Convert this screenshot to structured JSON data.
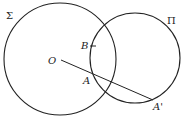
{
  "diagram": {
    "circles": [
      {
        "name": "Σ",
        "cx": 60,
        "cy": 59,
        "r": 56,
        "label_x": 6,
        "label_y": 19
      },
      {
        "name": "Π",
        "cx": 135,
        "cy": 58,
        "r": 45,
        "label_x": 167,
        "label_y": 24
      }
    ],
    "segment": {
      "from": "O",
      "to": "A'",
      "x1": 61,
      "y1": 60,
      "x2": 153,
      "y2": 100
    },
    "points": [
      {
        "name": "O",
        "x": 61,
        "y": 60,
        "label_x": 48,
        "label_y": 64
      },
      {
        "name": "B",
        "x": 93,
        "y": 46,
        "label_x": 81,
        "label_y": 49
      },
      {
        "name": "A",
        "x": 91,
        "y": 73,
        "label_x": 83,
        "label_y": 84
      },
      {
        "name": "A'",
        "x": 153,
        "y": 100,
        "label_x": 153,
        "label_y": 110
      }
    ],
    "stroke_color": "#222222"
  }
}
